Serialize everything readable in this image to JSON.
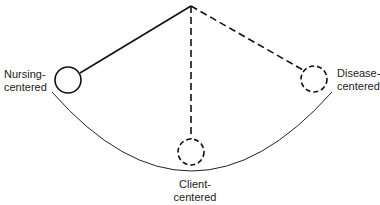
{
  "diagram": {
    "type": "pendulum",
    "positions": [
      {
        "id": "nursing",
        "line1": "Nursing-",
        "line2": "centered",
        "style": "solid"
      },
      {
        "id": "client",
        "line1": "Client-",
        "line2": "centered",
        "style": "dashed"
      },
      {
        "id": "disease",
        "line1": "Disease-",
        "line2": "centered",
        "style": "dashed"
      }
    ],
    "colors": {
      "stroke": "#111111",
      "background": "#ffffff"
    }
  }
}
